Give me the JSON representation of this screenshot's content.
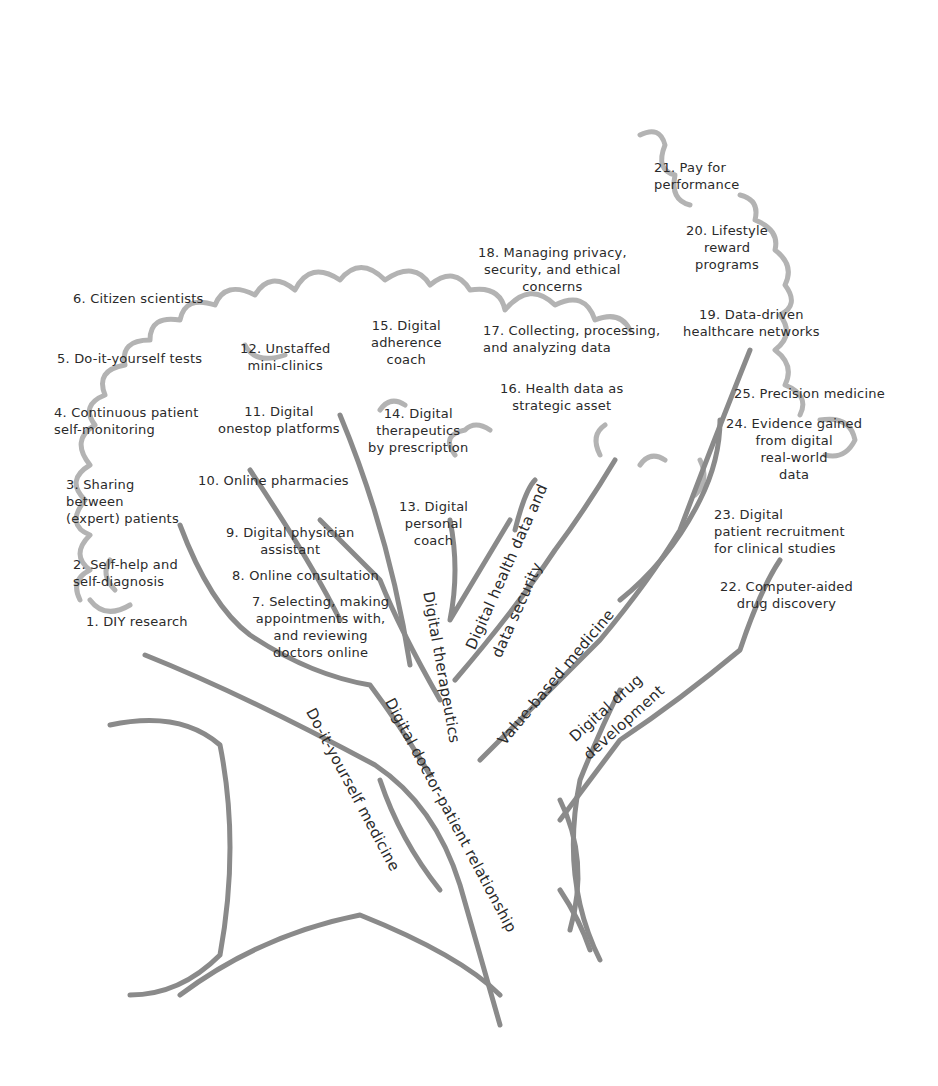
{
  "diagram": {
    "type": "tree-illustration",
    "colors": {
      "stroke": "#8f8f8f",
      "canopy": "#a9a9a9",
      "text": "#2a2a2a",
      "background": "#ffffff"
    },
    "branches": [
      {
        "id": "diy",
        "label": "Do-it-yourself medicine"
      },
      {
        "id": "doctor",
        "label": "Digital doctor-patient relationship"
      },
      {
        "id": "therapeutics",
        "label": "Digital therapeutics"
      },
      {
        "id": "data",
        "label_line1": "Digital health data and",
        "label_line2": "data security"
      },
      {
        "id": "value",
        "label": "Value-based medicine"
      },
      {
        "id": "drug",
        "label_line1": "Digital drug",
        "label_line2": "development"
      }
    ],
    "leaves": [
      {
        "n": 1,
        "text": "1. DIY research"
      },
      {
        "n": 2,
        "text": "2. Self-help and\nself-diagnosis"
      },
      {
        "n": 3,
        "text": "3. Sharing\nbetween\n(expert) patients"
      },
      {
        "n": 4,
        "text": "4. Continuous patient\nself-monitoring"
      },
      {
        "n": 5,
        "text": "5. Do-it-yourself tests"
      },
      {
        "n": 6,
        "text": "6. Citizen scientists"
      },
      {
        "n": 7,
        "text": "7. Selecting, making\nappointments with,\nand reviewing\ndoctors online"
      },
      {
        "n": 8,
        "text": "8. Online consultation"
      },
      {
        "n": 9,
        "text": "9. Digital physician\nassistant"
      },
      {
        "n": 10,
        "text": "10. Online pharmacies"
      },
      {
        "n": 11,
        "text": "11. Digital\nonestop platforms"
      },
      {
        "n": 12,
        "text": "12. Unstaffed\nmini-clinics"
      },
      {
        "n": 13,
        "text": "13. Digital\npersonal\ncoach"
      },
      {
        "n": 14,
        "text": "14. Digital\ntherapeutics\nby prescription"
      },
      {
        "n": 15,
        "text": "15. Digital\nadherence\ncoach"
      },
      {
        "n": 16,
        "text": "16. Health data as\nstrategic asset"
      },
      {
        "n": 17,
        "text": "17. Collecting, processing,\nand analyzing data"
      },
      {
        "n": 18,
        "text": "18. Managing privacy,\nsecurity, and ethical\nconcerns"
      },
      {
        "n": 19,
        "text": "19. Data-driven\nhealthcare networks"
      },
      {
        "n": 20,
        "text": "20. Lifestyle\nreward\nprograms"
      },
      {
        "n": 21,
        "text": "21. Pay for\nperformance"
      },
      {
        "n": 22,
        "text": "22. Computer-aided\ndrug discovery"
      },
      {
        "n": 23,
        "text": "23. Digital\npatient recruitment\nfor clinical studies"
      },
      {
        "n": 24,
        "text": "24. Evidence gained\nfrom digital\nreal-world\ndata"
      },
      {
        "n": 25,
        "text": "25. Precision medicine"
      }
    ]
  }
}
